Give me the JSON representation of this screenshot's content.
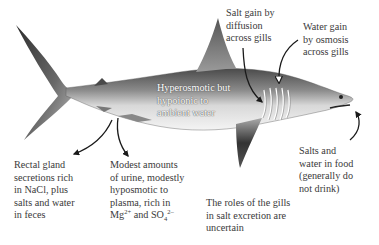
{
  "figure": {
    "body_label": {
      "lines": [
        "Hyperosmotic but",
        "hypoionic to",
        "ambient water"
      ]
    },
    "annotations": {
      "salt_gain": {
        "lines": [
          "Salt gain by",
          "diffusion",
          "across gills"
        ]
      },
      "water_gain": {
        "lines": [
          "Water gain",
          "by osmosis",
          "across gills"
        ]
      },
      "food": {
        "lines": [
          "Salts and",
          "water in food",
          "(generally do",
          "not drink)"
        ]
      },
      "rectal_gland": {
        "lines": [
          "Rectal gland",
          "secretions rich",
          "in NaCl, plus",
          "salts and water",
          "in feces"
        ]
      },
      "urine": {
        "lines": [
          "Modest amounts",
          "of urine, modestly",
          "hyposmotic to",
          "plasma, rich in"
        ],
        "last_line": {
          "mg": "Mg",
          "mg_sup": "2+",
          "and": " and SO",
          "so4_sub": "4",
          "so4_sup": "2–"
        }
      },
      "gills_role": {
        "lines": [
          "The roles of the gills",
          "in salt excretion are",
          "uncertain"
        ]
      }
    },
    "colors": {
      "shark_dark": "#3a3a3a",
      "shark_light": "#f2f2f2",
      "arrow": "#1a1a1a",
      "text": "#3a3a3a"
    }
  }
}
